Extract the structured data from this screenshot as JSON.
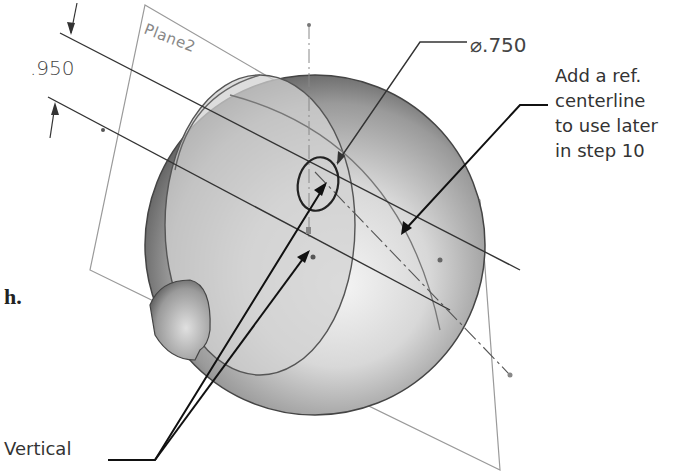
{
  "figure": {
    "plane_label": "Plane2",
    "dimension_offset": ".950",
    "dimension_diameter": "⌀.750",
    "callout_note": [
      "Add a ref.",
      "centerline",
      "to use later",
      "in step 10"
    ],
    "callout_vertical": "Vertical",
    "step_fragment": "h."
  },
  "colors": {
    "line": "#333333",
    "plane": "#999999",
    "sphere_light": "#eeeeee",
    "sphere_dark": "#555555",
    "text": "#333333"
  }
}
